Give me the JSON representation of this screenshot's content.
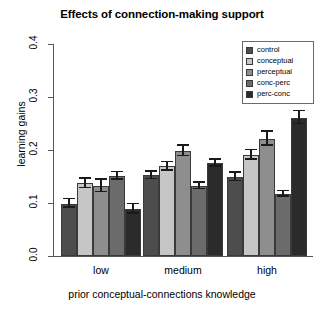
{
  "chart_data": {
    "type": "bar",
    "title": "Effects of connection-making support",
    "xlabel": "prior conceptual-connections knowledge",
    "ylabel": "learning gains",
    "categories": [
      "low",
      "medium",
      "high"
    ],
    "ylim": [
      0.0,
      0.4
    ],
    "yticks": [
      "0.0",
      "0.1",
      "0.2",
      "0.3",
      "0.4"
    ],
    "ytick_values": [
      0.0,
      0.1,
      0.2,
      0.3,
      0.4
    ],
    "grid": false,
    "legend_position": "top-right",
    "series": [
      {
        "name": "control",
        "color": "#4d4d4d",
        "values": [
          0.099,
          0.152,
          0.149
        ],
        "errors": [
          0.008,
          0.007,
          0.008
        ]
      },
      {
        "name": "conceptual",
        "color": "#c6c6c6",
        "values": [
          0.137,
          0.169,
          0.191
        ],
        "errors": [
          0.009,
          0.008,
          0.009
        ]
      },
      {
        "name": "perceptual",
        "color": "#8e8e8e",
        "values": [
          0.132,
          0.198,
          0.221
        ],
        "errors": [
          0.012,
          0.01,
          0.013
        ]
      },
      {
        "name": "conc-perc",
        "color": "#6b6b6b",
        "values": [
          0.151,
          0.132,
          0.117
        ],
        "errors": [
          0.007,
          0.006,
          0.005
        ]
      },
      {
        "name": "perc-conc",
        "color": "#2b2b2b",
        "values": [
          0.089,
          0.175,
          0.261
        ],
        "errors": [
          0.009,
          0.007,
          0.012
        ]
      }
    ]
  }
}
